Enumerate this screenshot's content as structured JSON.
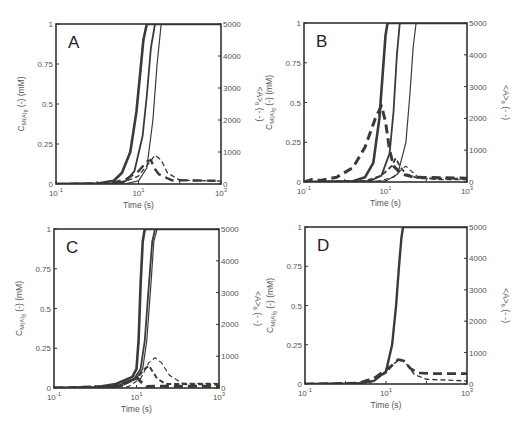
{
  "figure": {
    "panels": [
      "A",
      "B",
      "C",
      "D"
    ]
  },
  "chart_data": [
    {
      "type": "line",
      "panel_label": "A",
      "xlabel": "Time (s)",
      "ylabel_left": "C_M(A)_8 (-) (mM)",
      "ylabel_right": "<A>_8 (- -)",
      "xscale": "log",
      "xlim": [
        0.1,
        1000
      ],
      "xticks": [
        "10^-1",
        "10^1",
        "10^3"
      ],
      "ylim_left": [
        0,
        1
      ],
      "yticks_left": [
        "0",
        "0.25",
        "0.5",
        "0.75",
        "1"
      ],
      "ylim_right": [
        0,
        5000
      ],
      "yticks_right": [
        "0",
        "1000",
        "2000",
        "3000",
        "4000",
        "5000"
      ],
      "box": {
        "x0": 56,
        "y0": 24,
        "x1": 221,
        "y1": 184
      },
      "series": [
        {
          "name": "solid-1",
          "style": "solid",
          "width": 2.6,
          "axis": "left",
          "points": [
            [
              -1,
              0
            ],
            [
              0,
              0.003
            ],
            [
              0.4,
              0.02
            ],
            [
              0.6,
              0.07
            ],
            [
              0.8,
              0.2
            ],
            [
              0.95,
              0.45
            ],
            [
              1.05,
              0.72
            ],
            [
              1.12,
              0.9
            ],
            [
              1.2,
              1
            ]
          ]
        },
        {
          "name": "solid-2",
          "style": "solid",
          "width": 1.8,
          "axis": "left",
          "points": [
            [
              -1,
              0
            ],
            [
              0.4,
              0.003
            ],
            [
              0.7,
              0.02
            ],
            [
              0.9,
              0.08
            ],
            [
              1.1,
              0.3
            ],
            [
              1.2,
              0.55
            ],
            [
              1.3,
              0.85
            ],
            [
              1.4,
              1
            ]
          ]
        },
        {
          "name": "solid-3",
          "style": "solid",
          "width": 1.2,
          "axis": "left",
          "points": [
            [
              -1,
              0
            ],
            [
              0.7,
              0.003
            ],
            [
              1.0,
              0.02
            ],
            [
              1.2,
              0.1
            ],
            [
              1.35,
              0.4
            ],
            [
              1.45,
              0.75
            ],
            [
              1.55,
              1
            ]
          ]
        },
        {
          "name": "dashed-1",
          "style": "dash",
          "width": 2.4,
          "axis": "right",
          "points": [
            [
              -1,
              0
            ],
            [
              0.3,
              20
            ],
            [
              0.7,
              150
            ],
            [
              1.0,
              400
            ],
            [
              1.2,
              700
            ],
            [
              1.3,
              750
            ],
            [
              1.38,
              500
            ],
            [
              1.5,
              300
            ],
            [
              1.8,
              120
            ],
            [
              3,
              100
            ]
          ]
        },
        {
          "name": "dashed-2",
          "style": "dash",
          "width": 1.4,
          "axis": "right",
          "points": [
            [
              -1,
              0
            ],
            [
              0.6,
              30
            ],
            [
              1.0,
              250
            ],
            [
              1.25,
              650
            ],
            [
              1.4,
              900
            ],
            [
              1.55,
              750
            ],
            [
              1.7,
              350
            ],
            [
              2.0,
              120
            ],
            [
              3,
              90
            ]
          ]
        }
      ]
    },
    {
      "type": "line",
      "panel_label": "B",
      "xlabel": "Time (s)",
      "ylabel_left": "C_M(A)_8 (-) (mM)",
      "ylabel_right": "<A>_8 (- -)",
      "xscale": "log",
      "xlim": [
        0.1,
        1000
      ],
      "xticks": [
        "10^-1",
        "10^1",
        "10^3"
      ],
      "ylim_left": [
        0,
        1
      ],
      "yticks_left": [
        "0",
        "0.25",
        "0.5",
        "0.75",
        "1"
      ],
      "ylim_right": [
        0,
        5000
      ],
      "yticks_right": [
        "0",
        "1000",
        "2000",
        "3000",
        "4000",
        "5000"
      ],
      "box": {
        "x0": 304,
        "y0": 23,
        "x1": 467,
        "y1": 182
      },
      "series": [
        {
          "name": "solid-1",
          "style": "solid",
          "width": 2.6,
          "axis": "left",
          "points": [
            [
              -1,
              0
            ],
            [
              0.2,
              0.005
            ],
            [
              0.5,
              0.03
            ],
            [
              0.7,
              0.12
            ],
            [
              0.85,
              0.4
            ],
            [
              0.95,
              0.75
            ],
            [
              1.0,
              0.92
            ],
            [
              1.05,
              1
            ]
          ]
        },
        {
          "name": "solid-2",
          "style": "solid",
          "width": 1.8,
          "axis": "left",
          "points": [
            [
              -1,
              0
            ],
            [
              0.6,
              0.005
            ],
            [
              0.9,
              0.04
            ],
            [
              1.1,
              0.18
            ],
            [
              1.2,
              0.45
            ],
            [
              1.28,
              0.8
            ],
            [
              1.35,
              1
            ]
          ]
        },
        {
          "name": "solid-3",
          "style": "solid",
          "width": 1.2,
          "axis": "left",
          "points": [
            [
              -1,
              0
            ],
            [
              1.0,
              0.005
            ],
            [
              1.3,
              0.05
            ],
            [
              1.5,
              0.25
            ],
            [
              1.6,
              0.55
            ],
            [
              1.68,
              0.85
            ],
            [
              1.75,
              1
            ]
          ]
        },
        {
          "name": "dashed-1",
          "style": "dash",
          "width": 3.0,
          "axis": "right",
          "points": [
            [
              -1,
              0
            ],
            [
              -0.8,
              80
            ],
            [
              -0.6,
              50
            ],
            [
              -0.2,
              150
            ],
            [
              0.2,
              450
            ],
            [
              0.5,
              1100
            ],
            [
              0.75,
              2000
            ],
            [
              0.9,
              2400
            ],
            [
              1.0,
              1900
            ],
            [
              1.1,
              1000
            ],
            [
              1.2,
              500
            ],
            [
              1.4,
              250
            ],
            [
              1.7,
              150
            ],
            [
              3,
              120
            ]
          ]
        },
        {
          "name": "dashed-2",
          "style": "dash",
          "width": 1.8,
          "axis": "right",
          "points": [
            [
              -1,
              0
            ],
            [
              0.5,
              30
            ],
            [
              0.9,
              200
            ],
            [
              1.15,
              500
            ],
            [
              1.25,
              750
            ],
            [
              1.35,
              500
            ],
            [
              1.5,
              250
            ],
            [
              1.8,
              120
            ],
            [
              3,
              100
            ]
          ]
        },
        {
          "name": "dashed-3",
          "style": "dash",
          "width": 1.2,
          "axis": "right",
          "points": [
            [
              -1,
              0
            ],
            [
              0.8,
              20
            ],
            [
              1.2,
              150
            ],
            [
              1.4,
              400
            ],
            [
              1.5,
              500
            ],
            [
              1.6,
              380
            ],
            [
              1.8,
              150
            ],
            [
              2.2,
              80
            ],
            [
              3,
              70
            ]
          ]
        }
      ]
    },
    {
      "type": "line",
      "panel_label": "C",
      "xlabel": "Time (s)",
      "ylabel_left": "C_M(A)_8 (-) (mM)",
      "ylabel_right": "<A>_8 (- -)",
      "xscale": "log",
      "xlim": [
        0.1,
        1000
      ],
      "xticks": [
        "10^-1",
        "10^1",
        "10^3"
      ],
      "ylim_left": [
        0,
        1
      ],
      "yticks_left": [
        "0",
        "0.25",
        "0.5",
        "0.75",
        "1"
      ],
      "ylim_right": [
        0,
        5000
      ],
      "yticks_right": [
        "0",
        "1000",
        "2000",
        "3000",
        "4000",
        "5000"
      ],
      "box": {
        "x0": 54,
        "y0": 229,
        "x1": 219,
        "y1": 388
      },
      "series": [
        {
          "name": "solid-1",
          "style": "solid",
          "width": 2.6,
          "axis": "left",
          "points": [
            [
              -1,
              0
            ],
            [
              0,
              0.005
            ],
            [
              0.5,
              0.025
            ],
            [
              0.9,
              0.07
            ],
            [
              1.0,
              0.12
            ],
            [
              1.05,
              0.3
            ],
            [
              1.1,
              0.65
            ],
            [
              1.15,
              0.92
            ],
            [
              1.2,
              1
            ]
          ]
        },
        {
          "name": "solid-2",
          "style": "solid",
          "width": 1.8,
          "axis": "left",
          "points": [
            [
              -1,
              0
            ],
            [
              0.2,
              0.004
            ],
            [
              0.6,
              0.02
            ],
            [
              0.95,
              0.06
            ],
            [
              1.1,
              0.12
            ],
            [
              1.2,
              0.3
            ],
            [
              1.3,
              0.65
            ],
            [
              1.38,
              0.92
            ],
            [
              1.45,
              1
            ]
          ]
        },
        {
          "name": "solid-3",
          "style": "solid",
          "width": 1.2,
          "axis": "left",
          "points": [
            [
              -1,
              0
            ],
            [
              0.3,
              0.004
            ],
            [
              0.7,
              0.02
            ],
            [
              1.0,
              0.06
            ],
            [
              1.15,
              0.12
            ],
            [
              1.25,
              0.3
            ],
            [
              1.35,
              0.65
            ],
            [
              1.42,
              0.92
            ],
            [
              1.5,
              1
            ]
          ]
        },
        {
          "name": "dashed-1",
          "style": "dash",
          "width": 3.0,
          "axis": "right",
          "points": [
            [
              -1,
              0
            ],
            [
              0.5,
              50
            ],
            [
              0.9,
              250
            ],
            [
              1.0,
              350
            ],
            [
              1.1,
              200
            ],
            [
              1.25,
              50
            ],
            [
              3,
              60
            ]
          ]
        },
        {
          "name": "dashed-2",
          "style": "dash",
          "width": 2.0,
          "axis": "right",
          "points": [
            [
              -1,
              0
            ],
            [
              0.6,
              60
            ],
            [
              1.0,
              300
            ],
            [
              1.2,
              600
            ],
            [
              1.3,
              700
            ],
            [
              1.4,
              500
            ],
            [
              1.5,
              300
            ],
            [
              1.7,
              130
            ],
            [
              3,
              110
            ]
          ]
        },
        {
          "name": "dashed-3",
          "style": "dash",
          "width": 1.2,
          "axis": "right",
          "points": [
            [
              -1,
              0
            ],
            [
              0.8,
              40
            ],
            [
              1.1,
              300
            ],
            [
              1.3,
              800
            ],
            [
              1.45,
              950
            ],
            [
              1.6,
              800
            ],
            [
              1.8,
              400
            ],
            [
              2.1,
              150
            ],
            [
              3,
              140
            ]
          ]
        }
      ]
    },
    {
      "type": "line",
      "panel_label": "D",
      "xlabel": "Time (s)",
      "ylabel_left": "C_M(A)_8 (-) (mM)",
      "ylabel_right": "<A>_8 (- -)",
      "xscale": "log",
      "xlim": [
        0.1,
        1000
      ],
      "xticks": [
        "10^-1",
        "10^1",
        "10^3"
      ],
      "ylim_left": [
        0,
        1
      ],
      "yticks_left": [
        "0",
        "0.25",
        "0.5",
        "0.75",
        "1"
      ],
      "ylim_right": [
        0,
        5000
      ],
      "yticks_right": [
        "0",
        "1000",
        "2000",
        "3000",
        "4000",
        "5000"
      ],
      "box": {
        "x0": 305,
        "y0": 227,
        "x1": 467,
        "y1": 384
      },
      "series": [
        {
          "name": "solid-1",
          "style": "solid",
          "width": 2.4,
          "axis": "left",
          "points": [
            [
              -1,
              0
            ],
            [
              0.3,
              0.004
            ],
            [
              0.7,
              0.02
            ],
            [
              1.0,
              0.08
            ],
            [
              1.15,
              0.25
            ],
            [
              1.25,
              0.5
            ],
            [
              1.32,
              0.75
            ],
            [
              1.38,
              0.93
            ],
            [
              1.42,
              1
            ]
          ]
        },
        {
          "name": "dashed-1",
          "style": "dash",
          "width": 2.6,
          "axis": "right",
          "points": [
            [
              -1,
              0
            ],
            [
              0.3,
              30
            ],
            [
              0.7,
              180
            ],
            [
              1.0,
              450
            ],
            [
              1.15,
              600
            ],
            [
              1.3,
              780
            ],
            [
              1.45,
              730
            ],
            [
              1.6,
              500
            ],
            [
              1.8,
              350
            ],
            [
              2.2,
              330
            ],
            [
              3,
              330
            ]
          ]
        },
        {
          "name": "dashed-2",
          "style": "dash",
          "width": 1.4,
          "axis": "right",
          "points": [
            [
              -1,
              0
            ],
            [
              0.6,
              40
            ],
            [
              1.0,
              350
            ],
            [
              1.2,
              650
            ],
            [
              1.35,
              800
            ],
            [
              1.5,
              650
            ],
            [
              1.7,
              300
            ],
            [
              2.0,
              150
            ],
            [
              3,
              100
            ]
          ]
        }
      ]
    }
  ]
}
